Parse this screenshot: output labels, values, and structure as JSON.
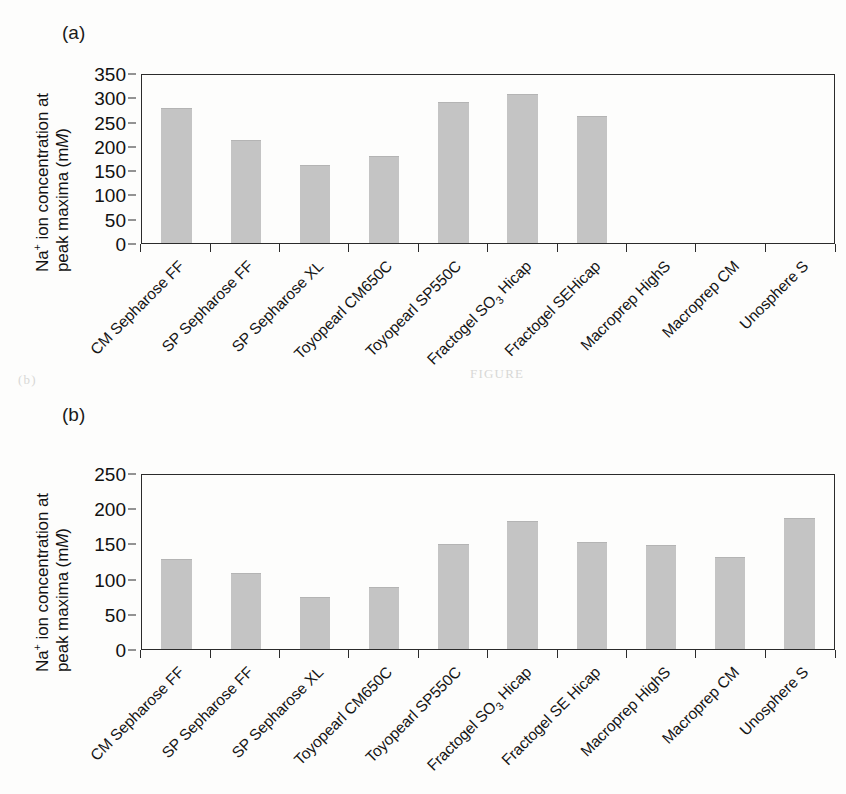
{
  "figure": {
    "ghost_text_left": "(b)",
    "ghost_text_right": "FIGURE"
  },
  "panel_a": {
    "panel_label": "(a)",
    "ylabel_line1": "Na",
    "ylabel_line1_sup": "+",
    "ylabel_line1_rest": " ion concentration at",
    "ylabel_line2_pre": "peak maxima (m",
    "ylabel_line2_em": "M",
    "ylabel_line2_post": ")"
  },
  "panel_b": {
    "panel_label": "(b)",
    "ylabel_line1": "Na",
    "ylabel_line1_sup": "+",
    "ylabel_line1_rest": " ion concentration at",
    "ylabel_line2_pre": "peak maxima (m",
    "ylabel_line2_em": "M",
    "ylabel_line2_post": ")"
  },
  "chart_data": [
    {
      "type": "bar",
      "panel": "(a)",
      "title": "",
      "xlabel": "",
      "ylabel": "Na+ ion concentration at peak maxima (mM)",
      "ylim": [
        0,
        350
      ],
      "yticks": [
        0,
        50,
        100,
        150,
        200,
        250,
        300,
        350
      ],
      "grid": false,
      "legend": false,
      "bar_color": "#c4c4c4",
      "axis_color": "#2b2b2b",
      "categories": [
        "CM Sepharose FF",
        "SP Sepharose FF",
        "SP Sepharose XL",
        "Toyopearl CM650C",
        "Toyopearl SP550C",
        "Fractogel SO3 Hicap",
        "Fractogel SEHicap",
        "Macroprep HighS",
        "Macroprep CM",
        "Unosphere S"
      ],
      "categories_rich": [
        {
          "text": "CM Sepharose FF"
        },
        {
          "text": "SP Sepharose FF"
        },
        {
          "text": "SP Sepharose XL"
        },
        {
          "text": "Toyopearl CM650C"
        },
        {
          "text": "Toyopearl SP550C"
        },
        {
          "pre": "Fractogel SO",
          "sub": "3",
          "post": " Hicap"
        },
        {
          "text": "Fractogel SEHicap"
        },
        {
          "text": "Macroprep HighS"
        },
        {
          "text": "Macroprep CM"
        },
        {
          "text": "Unosphere S"
        }
      ],
      "values": [
        282,
        214,
        162,
        181,
        293,
        310,
        264,
        0,
        0,
        0
      ]
    },
    {
      "type": "bar",
      "panel": "(b)",
      "title": "",
      "xlabel": "",
      "ylabel": "Na+ ion concentration at peak maxima (mM)",
      "ylim": [
        0,
        250
      ],
      "yticks": [
        0,
        50,
        100,
        150,
        200,
        250
      ],
      "grid": false,
      "legend": false,
      "bar_color": "#c4c4c4",
      "axis_color": "#2b2b2b",
      "categories": [
        "CM Sepharose FF",
        "SP Sepharose FF",
        "SP Sepharose XL",
        "Toyopearl CM650C",
        "Toyopearl SP550C",
        "Fractogel SO3 Hicap",
        "Fractogel SE Hicap",
        "Macroprep HighS",
        "Macroprep CM",
        "Unosphere S"
      ],
      "categories_rich": [
        {
          "text": "CM Sepharose FF"
        },
        {
          "text": "SP Sepharose FF"
        },
        {
          "text": "SP Sepharose XL"
        },
        {
          "text": "Toyopearl CM650C"
        },
        {
          "text": "Toyopearl SP550C"
        },
        {
          "pre": "Fractogel SO",
          "sub": "3",
          "post": " Hicap"
        },
        {
          "text": "Fractogel SE Hicap"
        },
        {
          "text": "Macroprep HighS"
        },
        {
          "text": "Macroprep CM"
        },
        {
          "text": "Unosphere S"
        }
      ],
      "values": [
        129,
        109,
        75,
        89,
        151,
        184,
        154,
        149,
        132,
        188
      ]
    }
  ]
}
